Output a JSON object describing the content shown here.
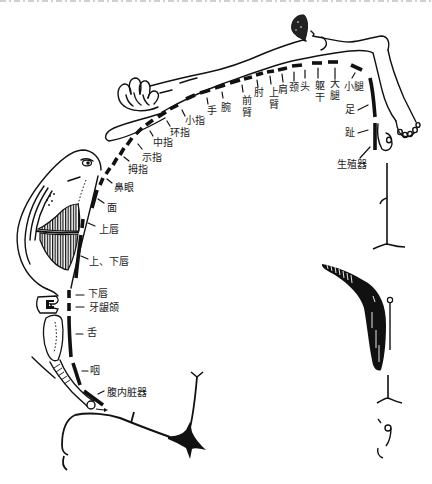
{
  "colors": {
    "ink": "#111111",
    "background": "#ffffff"
  },
  "labels": [
    {
      "text": "生殖器"
    },
    {
      "text": "趾"
    },
    {
      "text": "足"
    },
    {
      "text": "小腿"
    },
    {
      "text": "大腿"
    },
    {
      "text": "躯干"
    },
    {
      "text": "头"
    },
    {
      "text": "颈"
    },
    {
      "text": "肩"
    },
    {
      "text": "上臂"
    },
    {
      "text": "肘"
    },
    {
      "text": "前臂"
    },
    {
      "text": "腕"
    },
    {
      "text": "手"
    },
    {
      "text": "小指"
    },
    {
      "text": "环指"
    },
    {
      "text": "中指"
    },
    {
      "text": "示指"
    },
    {
      "text": "拇指"
    },
    {
      "text": "鼻眼"
    },
    {
      "text": "面"
    },
    {
      "text": "上唇"
    },
    {
      "text": "上、下唇"
    },
    {
      "text": "下唇"
    },
    {
      "text": "牙龈颌"
    },
    {
      "text": "舌"
    },
    {
      "text": "咽"
    },
    {
      "text": "腹内脏器"
    }
  ]
}
